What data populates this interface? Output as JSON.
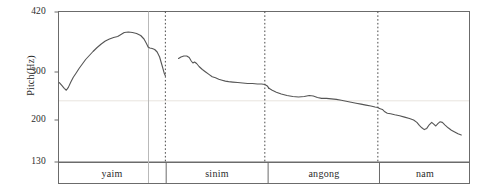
{
  "chart_data": {
    "type": "line",
    "title": "",
    "xlabel": "",
    "ylabel": "Pitch(Hz)",
    "ylim": [
      130,
      420
    ],
    "yticks": [
      130,
      200,
      300,
      420
    ],
    "ytick_labels": [
      "130",
      "200",
      "300",
      "420"
    ],
    "grid": "faint horizontal gridline at 240 Hz",
    "gridlines_y": [
      240
    ],
    "legend": "none",
    "x_axis": "time (unlabeled), segmented by syllable",
    "segments": [
      {
        "label": "yaim",
        "x_start": 0.0,
        "x_end": 0.262
      },
      {
        "label": "sinim",
        "x_start": 0.262,
        "x_end": 0.51
      },
      {
        "label": "angong",
        "x_start": 0.51,
        "x_end": 0.781
      },
      {
        "label": "nam",
        "x_start": 0.781,
        "x_end": 1.0
      }
    ],
    "dotted_markers_x": [
      0.26,
      0.502,
      0.777
    ],
    "solid_markers_x": [
      0.219
    ],
    "series": [
      {
        "name": "yaim",
        "points": [
          [
            0.002,
            278
          ],
          [
            0.008,
            272
          ],
          [
            0.014,
            266
          ],
          [
            0.019,
            262
          ],
          [
            0.024,
            268
          ],
          [
            0.03,
            279
          ],
          [
            0.036,
            289
          ],
          [
            0.043,
            298
          ],
          [
            0.05,
            307
          ],
          [
            0.058,
            316
          ],
          [
            0.066,
            325
          ],
          [
            0.075,
            333
          ],
          [
            0.084,
            341
          ],
          [
            0.094,
            349
          ],
          [
            0.104,
            356
          ],
          [
            0.114,
            362
          ],
          [
            0.124,
            366
          ],
          [
            0.134,
            369
          ],
          [
            0.144,
            371
          ],
          [
            0.152,
            375
          ],
          [
            0.16,
            379
          ],
          [
            0.17,
            380
          ],
          [
            0.18,
            379
          ],
          [
            0.19,
            377
          ],
          [
            0.2,
            373
          ],
          [
            0.208,
            366
          ],
          [
            0.214,
            357
          ],
          [
            0.218,
            350
          ],
          [
            0.222,
            348
          ],
          [
            0.228,
            347
          ],
          [
            0.234,
            345
          ],
          [
            0.24,
            340
          ],
          [
            0.246,
            330
          ],
          [
            0.252,
            313
          ],
          [
            0.257,
            298
          ],
          [
            0.26,
            292
          ]
        ]
      },
      {
        "name": "sinim",
        "points": [
          [
            0.292,
            327
          ],
          [
            0.298,
            330
          ],
          [
            0.305,
            332
          ],
          [
            0.312,
            332
          ],
          [
            0.318,
            329
          ],
          [
            0.323,
            322
          ],
          [
            0.327,
            318
          ],
          [
            0.331,
            320
          ],
          [
            0.336,
            317
          ],
          [
            0.342,
            311
          ],
          [
            0.35,
            305
          ],
          [
            0.358,
            300
          ],
          [
            0.366,
            295
          ],
          [
            0.374,
            290
          ],
          [
            0.382,
            288
          ],
          [
            0.39,
            285
          ],
          [
            0.398,
            283
          ],
          [
            0.406,
            281
          ],
          [
            0.414,
            280
          ],
          [
            0.424,
            279
          ],
          [
            0.436,
            278
          ],
          [
            0.448,
            277
          ],
          [
            0.46,
            276
          ],
          [
            0.472,
            276
          ],
          [
            0.484,
            275
          ],
          [
            0.494,
            275
          ],
          [
            0.502,
            274
          ],
          [
            0.508,
            271
          ],
          [
            0.512,
            266
          ]
        ]
      },
      {
        "name": "angong",
        "points": [
          [
            0.512,
            266
          ],
          [
            0.52,
            262
          ],
          [
            0.53,
            258
          ],
          [
            0.542,
            254
          ],
          [
            0.556,
            251
          ],
          [
            0.57,
            249
          ],
          [
            0.584,
            248
          ],
          [
            0.598,
            249
          ],
          [
            0.61,
            251
          ],
          [
            0.62,
            250
          ],
          [
            0.63,
            247
          ],
          [
            0.64,
            245
          ],
          [
            0.652,
            245
          ],
          [
            0.664,
            244
          ],
          [
            0.676,
            243
          ],
          [
            0.688,
            241
          ],
          [
            0.7,
            239
          ],
          [
            0.712,
            237
          ],
          [
            0.724,
            235
          ],
          [
            0.736,
            233
          ],
          [
            0.748,
            231
          ],
          [
            0.76,
            229
          ],
          [
            0.77,
            227
          ],
          [
            0.777,
            226
          ],
          [
            0.781,
            224
          ]
        ]
      },
      {
        "name": "nam",
        "points": [
          [
            0.781,
            224
          ],
          [
            0.788,
            222
          ],
          [
            0.794,
            217
          ],
          [
            0.8,
            214
          ],
          [
            0.808,
            213
          ],
          [
            0.818,
            211
          ],
          [
            0.83,
            209
          ],
          [
            0.842,
            206
          ],
          [
            0.854,
            203
          ],
          [
            0.864,
            200
          ],
          [
            0.872,
            196
          ],
          [
            0.878,
            191
          ],
          [
            0.884,
            187
          ],
          [
            0.89,
            184
          ],
          [
            0.896,
            186
          ],
          [
            0.902,
            192
          ],
          [
            0.908,
            196
          ],
          [
            0.913,
            193
          ],
          [
            0.918,
            190
          ],
          [
            0.923,
            194
          ],
          [
            0.928,
            197
          ],
          [
            0.934,
            196
          ],
          [
            0.94,
            192
          ],
          [
            0.948,
            187
          ],
          [
            0.956,
            183
          ],
          [
            0.964,
            180
          ],
          [
            0.972,
            177
          ],
          [
            0.98,
            175
          ]
        ]
      }
    ]
  },
  "axis": {
    "y_title": "Pitch(Hz)",
    "tick_420": "420",
    "tick_300": "300",
    "tick_200": "200",
    "tick_130": "130"
  },
  "segment_labels": {
    "s1": "yaim",
    "s2": "sinim",
    "s3": "angong",
    "s4": "nam"
  },
  "colors": {
    "line": "#555555",
    "frame": "#6b6b6b",
    "grid": "#e8e4de",
    "dotted": "#4a4a4a",
    "text": "#2b2b2b",
    "background": "#ffffff"
  }
}
